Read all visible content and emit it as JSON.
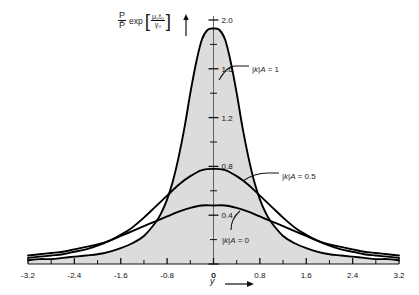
{
  "chart_data": {
    "type": "line",
    "title": "",
    "ylabel_text": "P/P̄ exp[μ₀t₀/γ₀]",
    "ylabel_parts": {
      "numerator": "P",
      "denominator": "P̄",
      "exp": "exp",
      "bracket_open": "[",
      "bracket_close": "]",
      "inner_numerator": "μ₀t₀",
      "inner_denominator": "γ₀"
    },
    "xlabel": "y",
    "xlim": [
      -3.2,
      3.2
    ],
    "ylim": [
      0,
      2.0
    ],
    "xticks": [
      -3.2,
      -2.4,
      -1.6,
      -0.8,
      0,
      0.8,
      1.6,
      2.4,
      3.2
    ],
    "xtick_labels": [
      "-3.2",
      "-2.4",
      "-1.6",
      "-0.8",
      "0",
      "0.8",
      "1.6",
      "2.4",
      "3.2"
    ],
    "xminor_step": 0.4,
    "yticks": [
      0,
      0.4,
      0.8,
      1.2,
      1.6,
      2.0
    ],
    "ytick_labels": [
      "0",
      "0.4",
      "0.8",
      "1.2",
      "1.6",
      "2.0"
    ],
    "yminor_step": 0.2,
    "grid": false,
    "legend": "inline-annotations",
    "shaded_under_top_curve": true,
    "shade_color": "#dcdcdc",
    "line_color": "#000000",
    "series": [
      {
        "name": "|k|A = 1",
        "label": "|k|A = 1",
        "peak": 1.93,
        "halfwidth": 0.42,
        "x": [
          -3.2,
          -3.0,
          -2.8,
          -2.6,
          -2.4,
          -2.2,
          -2.0,
          -1.8,
          -1.6,
          -1.4,
          -1.2,
          -1.0,
          -0.9,
          -0.8,
          -0.7,
          -0.6,
          -0.5,
          -0.4,
          -0.3,
          -0.2,
          -0.1,
          0,
          0.1,
          0.2,
          0.3,
          0.4,
          0.5,
          0.6,
          0.7,
          0.8,
          0.9,
          1.0,
          1.2,
          1.4,
          1.6,
          1.8,
          2.0,
          2.2,
          2.4,
          2.6,
          2.8,
          3.0,
          3.2
        ],
        "y": [
          0.03,
          0.04,
          0.04,
          0.05,
          0.06,
          0.07,
          0.08,
          0.1,
          0.13,
          0.17,
          0.23,
          0.34,
          0.42,
          0.53,
          0.68,
          0.88,
          1.12,
          1.4,
          1.65,
          1.84,
          1.92,
          1.93,
          1.92,
          1.84,
          1.65,
          1.4,
          1.12,
          0.88,
          0.68,
          0.53,
          0.42,
          0.34,
          0.23,
          0.17,
          0.13,
          0.1,
          0.08,
          0.07,
          0.06,
          0.05,
          0.04,
          0.04,
          0.03
        ]
      },
      {
        "name": "|k|A = 0.5",
        "label": "|k|A = 0.5",
        "peak": 0.78,
        "halfwidth": 0.95,
        "x": [
          -3.2,
          -3.0,
          -2.8,
          -2.6,
          -2.4,
          -2.2,
          -2.0,
          -1.8,
          -1.6,
          -1.4,
          -1.2,
          -1.0,
          -0.8,
          -0.6,
          -0.4,
          -0.2,
          0,
          0.2,
          0.4,
          0.6,
          0.8,
          1.0,
          1.2,
          1.4,
          1.6,
          1.8,
          2.0,
          2.2,
          2.4,
          2.6,
          2.8,
          3.0,
          3.2
        ],
        "y": [
          0.05,
          0.06,
          0.07,
          0.08,
          0.1,
          0.12,
          0.15,
          0.19,
          0.24,
          0.3,
          0.38,
          0.47,
          0.56,
          0.65,
          0.72,
          0.77,
          0.78,
          0.77,
          0.72,
          0.65,
          0.56,
          0.47,
          0.38,
          0.3,
          0.24,
          0.19,
          0.15,
          0.12,
          0.1,
          0.08,
          0.07,
          0.06,
          0.05
        ]
      },
      {
        "name": "|k|A = 0",
        "label": "|k|A = 0",
        "peak": 0.48,
        "halfwidth": 1.45,
        "x": [
          -3.2,
          -3.0,
          -2.8,
          -2.6,
          -2.4,
          -2.2,
          -2.0,
          -1.8,
          -1.6,
          -1.4,
          -1.2,
          -1.0,
          -0.8,
          -0.6,
          -0.4,
          -0.2,
          0,
          0.2,
          0.4,
          0.6,
          0.8,
          1.0,
          1.2,
          1.4,
          1.6,
          1.8,
          2.0,
          2.2,
          2.4,
          2.6,
          2.8,
          3.0,
          3.2
        ],
        "y": [
          0.07,
          0.08,
          0.09,
          0.1,
          0.12,
          0.14,
          0.16,
          0.19,
          0.23,
          0.27,
          0.31,
          0.35,
          0.39,
          0.43,
          0.46,
          0.48,
          0.48,
          0.48,
          0.46,
          0.43,
          0.39,
          0.35,
          0.31,
          0.27,
          0.23,
          0.19,
          0.16,
          0.14,
          0.12,
          0.1,
          0.09,
          0.08,
          0.07
        ]
      }
    ],
    "annotations": [
      {
        "name": "label-k1",
        "text": "|k|A = 1",
        "x_px": 252,
        "y_px": 65
      },
      {
        "name": "label-k05",
        "text": "|k|A = 0.5",
        "x_px": 282,
        "y_px": 172
      },
      {
        "name": "label-k0",
        "text": "|k|A = 0",
        "x_px": 222,
        "y_px": 236
      }
    ]
  }
}
